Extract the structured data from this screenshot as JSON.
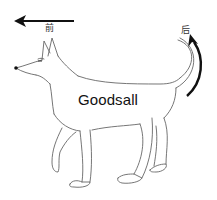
{
  "figure": {
    "main_label": "Goodsall",
    "front_label": "前",
    "back_label": "后",
    "arrows": [
      {
        "name": "front-arrow",
        "direction": "left",
        "label": "前"
      },
      {
        "name": "back-arrow",
        "direction": "curved-up",
        "label": "后"
      }
    ],
    "colors": {
      "background": "#ffffff",
      "line": "#555555",
      "arrow": "#111111",
      "text": "#111111"
    }
  }
}
